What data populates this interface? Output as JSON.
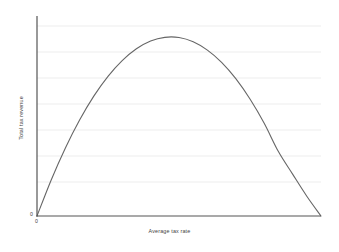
{
  "figure": {
    "background_color": "#ffffff",
    "axis_color": "#555555",
    "grid_color": "#ededed",
    "curve_color": "#666666"
  },
  "labels": {
    "x_axis_title": "Average tax rate",
    "y_axis_title": "Total tax revenue",
    "y_origin_tick": "0",
    "x_origin_tick": "0"
  },
  "chart_data": {
    "type": "line",
    "title": "",
    "subtitle": "",
    "xlabel": "Average tax rate",
    "ylabel": "Total tax revenue",
    "xlim": [
      0,
      100
    ],
    "ylim": [
      0,
      100
    ],
    "xticks": [
      0
    ],
    "xticklabels": [
      "0"
    ],
    "yticks": [
      0
    ],
    "yticklabels": [
      "0"
    ],
    "grid": true,
    "grid_axis": "y",
    "grid_count": 7,
    "grid_values": [
      12.5,
      25,
      37.5,
      50,
      62.5,
      75,
      87.5
    ],
    "legend": null,
    "legend_position": "none",
    "annotations": [],
    "series": [
      {
        "name": "Laffer curve",
        "color": "#666666",
        "x": [
          0,
          5,
          10,
          15,
          20,
          25,
          30,
          35,
          40,
          45,
          50,
          55,
          60,
          65,
          70,
          75,
          80,
          85,
          90,
          95,
          100
        ],
        "y": [
          0,
          18.6,
          35.1,
          49.5,
          61.8,
          72.0,
          80.1,
          86.2,
          90.2,
          92.1,
          92.0,
          89.8,
          85.5,
          79.2,
          70.8,
          60.3,
          47.8,
          33.2,
          21.6,
          10.2,
          0
        ]
      }
    ]
  }
}
